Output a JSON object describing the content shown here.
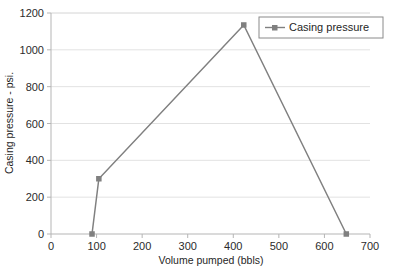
{
  "chart_data": {
    "type": "line",
    "title": "",
    "xlabel": "Volume pumped (bbls)",
    "ylabel": "Casing pressure - psi.",
    "xlim": [
      0,
      700
    ],
    "ylim": [
      0,
      1200
    ],
    "xticks": [
      0,
      100,
      200,
      300,
      400,
      500,
      600,
      700
    ],
    "yticks": [
      0,
      200,
      400,
      600,
      800,
      1000,
      1200
    ],
    "xtick_labels": [
      "0",
      "100",
      "200",
      "300",
      "400",
      "500",
      "600",
      "700"
    ],
    "ytick_labels": [
      "0",
      "200",
      "400",
      "600",
      "800",
      "1000",
      "1200"
    ],
    "grid": "horizontal",
    "legend_position": "top-right",
    "series": [
      {
        "name": "Casing pressure",
        "color": "#808080",
        "marker": "square",
        "x": [
          90,
          105,
          423,
          648
        ],
        "y": [
          0,
          300,
          1135,
          0
        ]
      }
    ]
  },
  "legend": {
    "entries": [
      {
        "label": "Casing pressure"
      }
    ]
  },
  "colors": {
    "series": "#808080",
    "grid": "#e2e2e2",
    "axis": "#b5b5b5",
    "text": "#1f1f1f",
    "background": "#ffffff",
    "legend_border": "#8a8a8a"
  }
}
